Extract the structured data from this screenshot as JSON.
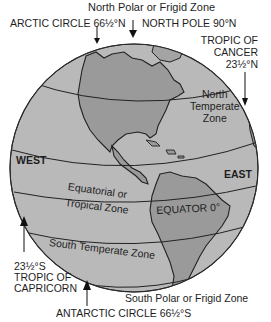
{
  "colors": {
    "ocean": "#b9b9b9",
    "land": "#9a9a9a",
    "outline": "#2a2a2a",
    "text": "#1e1e1e"
  },
  "labels": {
    "north_polar_zone": "North Polar or Frigid Zone",
    "arctic_circle": "ARCTIC CIRCLE 66½°N",
    "north_pole": "NORTH POLE 90°N",
    "tropic_cancer_line1": "TROPIC OF",
    "tropic_cancer_line2": "CANCER",
    "tropic_cancer_line3": "23½°N",
    "north_temperate_line1": "North",
    "north_temperate_line2": "Temperate",
    "north_temperate_line3": "Zone",
    "west": "WEST",
    "east": "EAST",
    "equatorial_line1": "Equatorial or",
    "equatorial_line2": "Tropical Zone",
    "equator": "EQUATOR 0°",
    "south_temperate": "South Temperate Zone",
    "tropic_capricorn_line1": "23½°S",
    "tropic_capricorn_line2": "TROPIC OF",
    "tropic_capricorn_line3": "CAPRICORN",
    "south_polar_zone": "South Polar or Frigid Zone",
    "antarctic_circle": "ANTARCTIC CIRCLE 66½°S"
  }
}
